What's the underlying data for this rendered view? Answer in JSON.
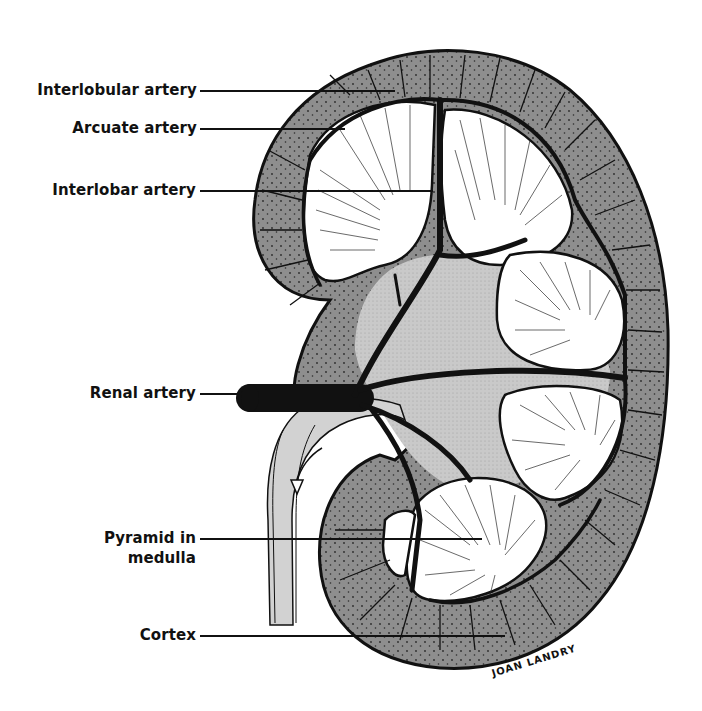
{
  "diagram": {
    "labels": [
      {
        "id": "interlobular-artery",
        "text": "Interlobular artery"
      },
      {
        "id": "arcuate-artery",
        "text": "Arcuate artery"
      },
      {
        "id": "interlobar-artery",
        "text": "Interlobar artery"
      },
      {
        "id": "renal-artery",
        "text": "Renal artery"
      },
      {
        "id": "pyramid-in-medulla",
        "text": "Pyramid in medulla",
        "lines": [
          "Pyramid in",
          "medulla"
        ]
      },
      {
        "id": "cortex",
        "text": "Cortex"
      }
    ],
    "signature": "JOAN LANDRY",
    "colors": {
      "cortex": "#8e8e8e",
      "sinus": "#c8c8c8",
      "pyramid": "#ffffff",
      "vessel": "#111111",
      "background": "#ffffff"
    }
  }
}
